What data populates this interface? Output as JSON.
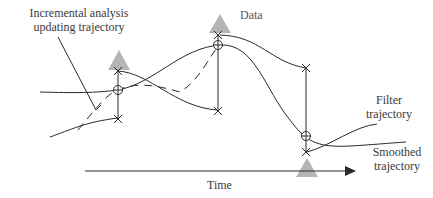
{
  "labels": {
    "incremental_line1": "Incremental analysis",
    "incremental_line2": "updating trajectory",
    "data": "Data",
    "filter_line1": "Filter",
    "filter_line2": "trajectory",
    "smoothed_line1": "Smoothed",
    "smoothed_line2": "trajectory",
    "time": "Time"
  },
  "colors": {
    "line": "#2a2a2a",
    "data_marker": "#b5b5b5",
    "text": "#3a3a3a"
  },
  "markers": {
    "data_triangles": 3,
    "update_points": 3
  }
}
